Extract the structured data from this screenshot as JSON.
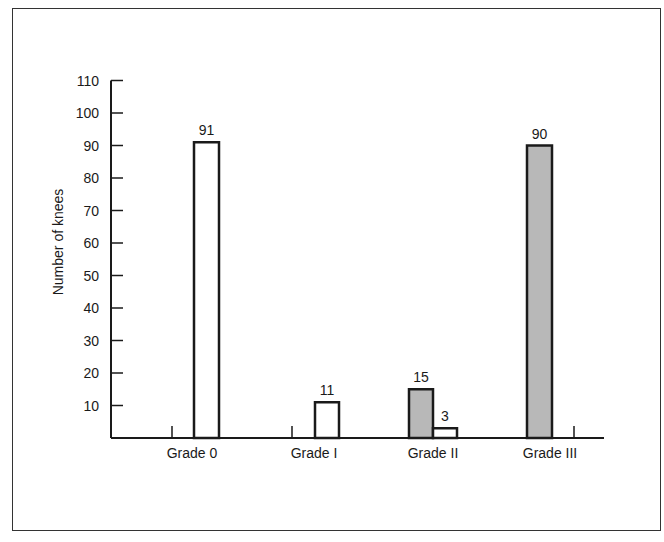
{
  "chart_data": {
    "type": "bar",
    "title": "",
    "xlabel": "",
    "ylabel": "Number  of knees",
    "ylim": [
      0,
      110
    ],
    "yticks": [
      10,
      20,
      30,
      40,
      50,
      60,
      70,
      80,
      90,
      100,
      110
    ],
    "grid": false,
    "legend": null,
    "categories": [
      "Grade 0",
      "Grade I",
      "Grade II",
      "Grade III"
    ],
    "series": [
      {
        "name": "unshaded",
        "fill": "#ffffff",
        "values": [
          91,
          11,
          3,
          null
        ]
      },
      {
        "name": "shaded",
        "fill": "#b8b8b8",
        "values": [
          null,
          null,
          15,
          90
        ]
      }
    ],
    "bars": [
      {
        "category": "Grade 0",
        "value": 91,
        "shaded": false,
        "label": "91"
      },
      {
        "category": "Grade I",
        "value": 11,
        "shaded": false,
        "label": "11"
      },
      {
        "category": "Grade II",
        "value": 15,
        "shaded": true,
        "label": "15"
      },
      {
        "category": "Grade II",
        "value": 3,
        "shaded": false,
        "label": "3"
      },
      {
        "category": "Grade III",
        "value": 90,
        "shaded": true,
        "label": "90"
      }
    ]
  },
  "colors": {
    "axis": "#1a1a1a",
    "shaded_fill": "#b8b8b8",
    "unshaded_fill": "#ffffff"
  }
}
